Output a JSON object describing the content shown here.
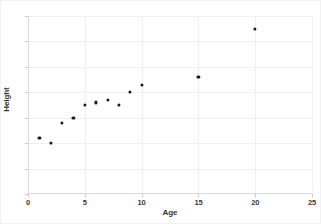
{
  "chart_data": {
    "type": "scatter",
    "title": "",
    "xlabel": "Age",
    "ylabel": "Height",
    "xlim": [
      0,
      25
    ],
    "ylim": [
      0,
      70
    ],
    "xticks": [
      0,
      5,
      10,
      15,
      20,
      25
    ],
    "yticks": [
      0,
      10,
      20,
      30,
      40,
      50,
      60,
      70
    ],
    "xtick_labels": [
      "0",
      "5",
      "10",
      "15",
      "20",
      "25"
    ],
    "ytick_labels": [
      "0",
      "10",
      "20",
      "30",
      "40",
      "50",
      "60",
      "70"
    ],
    "grid": true,
    "legend": false,
    "marker": "circle",
    "marker_color": "#1a1a1a",
    "x": [
      1,
      2,
      3,
      4,
      5,
      6,
      7,
      8,
      9,
      10,
      15,
      20
    ],
    "y": [
      22,
      20,
      28,
      30,
      35,
      36,
      37,
      35,
      40,
      43,
      46,
      65
    ],
    "points": [
      {
        "x": 1,
        "y": 22
      },
      {
        "x": 2,
        "y": 20
      },
      {
        "x": 3,
        "y": 28
      },
      {
        "x": 4,
        "y": 30
      },
      {
        "x": 5,
        "y": 35
      },
      {
        "x": 6,
        "y": 36
      },
      {
        "x": 7,
        "y": 37
      },
      {
        "x": 8,
        "y": 35
      },
      {
        "x": 9,
        "y": 40
      },
      {
        "x": 10,
        "y": 43
      },
      {
        "x": 15,
        "y": 46
      },
      {
        "x": 20,
        "y": 65
      }
    ]
  },
  "colors": {
    "background": "#ffffff",
    "grid": "#f0f0f0",
    "axis": "#d9d9d9",
    "text": "#333333",
    "marker": "#1a1a1a"
  }
}
